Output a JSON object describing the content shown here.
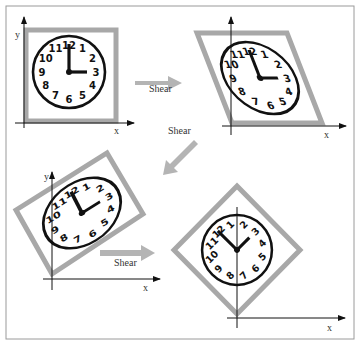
{
  "figure": {
    "colors": {
      "frame": "#a8a8a8",
      "frame_inner": "#ffffff",
      "arrow": "#b4b4b4",
      "ink": "#111111",
      "border": "#9a9a9a"
    },
    "panels": [
      {
        "id": "original",
        "label": "",
        "clock_time": "3:00",
        "axis_x": "x",
        "axis_y": "y"
      },
      {
        "id": "shear-1",
        "label": "",
        "clock_time": "3:00",
        "axis_x": "x",
        "axis_y": ""
      },
      {
        "id": "shear-2",
        "label": "",
        "clock_time": "3:00",
        "axis_x": "x",
        "axis_y": "y"
      },
      {
        "id": "shear-3-rotated",
        "label": "",
        "clock_time": "3:00",
        "axis_x": "x",
        "axis_y": ""
      }
    ],
    "arrows": [
      {
        "label": "Shear"
      },
      {
        "label": "Shear"
      },
      {
        "label": "Shear"
      }
    ],
    "clock_numbers": [
      "12",
      "1",
      "2",
      "3",
      "4",
      "5",
      "6",
      "7",
      "8",
      "9",
      "10",
      "11"
    ]
  }
}
